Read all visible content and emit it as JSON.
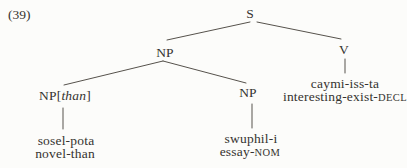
{
  "colors": {
    "background": "#fcfcfa",
    "text": "#35332f",
    "line": "#56524c"
  },
  "figure": {
    "example_number": "(39)",
    "nodes": {
      "s": "S",
      "np_subject": "NP",
      "v": "V",
      "np_than_open": "NP[",
      "np_than_feature": "than",
      "np_than_close": "]",
      "np_object": "NP"
    },
    "leaves": {
      "sosel": {
        "word": "sosel-pota",
        "gloss": "novel-than"
      },
      "swuphil": {
        "word": "swuphil-i",
        "gloss_base": "essay-",
        "gloss_caps": "NOM"
      },
      "caymi": {
        "word": "caymi-iss-ta",
        "gloss_base": "interesting-exist-",
        "gloss_caps": "DECL"
      }
    }
  }
}
